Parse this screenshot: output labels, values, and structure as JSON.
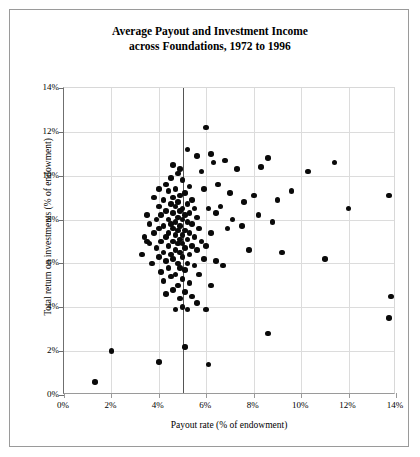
{
  "chart_data": {
    "type": "scatter",
    "title": "Average Payout and Investment Income across Foundations, 1972 to 1996",
    "title_line1": "Average Payout and Investment Income",
    "title_line2": "across Foundations, 1972 to 1996",
    "xlabel": "Payout rate (% of endowment)",
    "ylabel": "Total return on investments (% of endowment)",
    "xlim": [
      0,
      14
    ],
    "ylim": [
      0,
      14
    ],
    "xticks": [
      0,
      2,
      4,
      6,
      8,
      10,
      12,
      14
    ],
    "yticks": [
      0,
      2,
      4,
      6,
      8,
      10,
      12,
      14
    ],
    "xtick_labels": [
      "0%",
      "2%",
      "4%",
      "6%",
      "8%",
      "10%",
      "12%",
      "14%"
    ],
    "ytick_labels": [
      "0%",
      "2%",
      "4%",
      "6%",
      "8%",
      "10%",
      "12%",
      "14%"
    ],
    "grid": true,
    "legend": null,
    "marker_color": "#0a0a0a",
    "annotations": [
      {
        "type": "vline",
        "x": 5.0,
        "label": "5% payout reference line",
        "color": "#555555"
      }
    ],
    "points": [
      [
        1.3,
        0.6
      ],
      [
        2.0,
        2.0
      ],
      [
        4.0,
        1.5
      ],
      [
        5.1,
        2.2
      ],
      [
        6.1,
        1.4
      ],
      [
        8.6,
        2.8
      ],
      [
        13.7,
        3.5
      ],
      [
        13.8,
        4.5
      ],
      [
        11.0,
        6.2
      ],
      [
        6.0,
        12.2
      ],
      [
        5.2,
        11.2
      ],
      [
        5.6,
        10.9
      ],
      [
        4.6,
        10.5
      ],
      [
        4.9,
        10.3
      ],
      [
        4.8,
        10.1
      ],
      [
        4.5,
        9.9
      ],
      [
        5.0,
        9.8
      ],
      [
        4.3,
        9.6
      ],
      [
        5.3,
        9.5
      ],
      [
        4.7,
        9.4
      ],
      [
        4.4,
        9.3
      ],
      [
        5.1,
        9.2
      ],
      [
        4.9,
        9.1
      ],
      [
        4.6,
        9.0
      ],
      [
        5.4,
        8.9
      ],
      [
        4.2,
        8.9
      ],
      [
        4.8,
        8.8
      ],
      [
        5.2,
        8.7
      ],
      [
        4.5,
        8.7
      ],
      [
        4.0,
        8.6
      ],
      [
        4.7,
        8.6
      ],
      [
        5.0,
        8.5
      ],
      [
        5.5,
        8.5
      ],
      [
        4.3,
        8.4
      ],
      [
        4.9,
        8.4
      ],
      [
        5.3,
        8.3
      ],
      [
        4.6,
        8.3
      ],
      [
        4.1,
        8.2
      ],
      [
        5.1,
        8.2
      ],
      [
        4.8,
        8.1
      ],
      [
        5.6,
        8.1
      ],
      [
        4.4,
        8.0
      ],
      [
        5.0,
        8.0
      ],
      [
        3.9,
        8.0
      ],
      [
        4.7,
        7.9
      ],
      [
        5.2,
        7.9
      ],
      [
        4.5,
        7.8
      ],
      [
        5.4,
        7.8
      ],
      [
        4.2,
        7.7
      ],
      [
        4.9,
        7.7
      ],
      [
        5.7,
        7.6
      ],
      [
        4.6,
        7.6
      ],
      [
        4.0,
        7.6
      ],
      [
        5.1,
        7.5
      ],
      [
        4.8,
        7.5
      ],
      [
        5.3,
        7.4
      ],
      [
        4.4,
        7.4
      ],
      [
        3.8,
        7.4
      ],
      [
        5.0,
        7.3
      ],
      [
        4.7,
        7.3
      ],
      [
        5.5,
        7.2
      ],
      [
        4.3,
        7.2
      ],
      [
        4.9,
        7.1
      ],
      [
        5.2,
        7.1
      ],
      [
        4.1,
        7.0
      ],
      [
        4.6,
        7.0
      ],
      [
        5.8,
        7.0
      ],
      [
        3.5,
        7.0
      ],
      [
        5.0,
        6.9
      ],
      [
        4.8,
        6.9
      ],
      [
        5.4,
        6.8
      ],
      [
        4.4,
        6.8
      ],
      [
        3.9,
        6.7
      ],
      [
        5.1,
        6.7
      ],
      [
        4.7,
        6.6
      ],
      [
        5.6,
        6.6
      ],
      [
        4.2,
        6.5
      ],
      [
        4.9,
        6.5
      ],
      [
        5.3,
        6.4
      ],
      [
        4.5,
        6.4
      ],
      [
        4.0,
        6.3
      ],
      [
        5.0,
        6.3
      ],
      [
        5.9,
        6.2
      ],
      [
        4.6,
        6.2
      ],
      [
        4.3,
        6.1
      ],
      [
        5.2,
        6.0
      ],
      [
        4.8,
        6.0
      ],
      [
        3.7,
        6.0
      ],
      [
        5.5,
        5.9
      ],
      [
        4.4,
        5.8
      ],
      [
        4.9,
        5.8
      ],
      [
        5.1,
        5.7
      ],
      [
        4.1,
        5.6
      ],
      [
        4.7,
        5.5
      ],
      [
        5.7,
        5.5
      ],
      [
        4.5,
        5.4
      ],
      [
        5.0,
        5.3
      ],
      [
        4.2,
        5.2
      ],
      [
        5.3,
        5.1
      ],
      [
        4.8,
        5.0
      ],
      [
        6.2,
        5.0
      ],
      [
        4.6,
        4.8
      ],
      [
        5.1,
        4.7
      ],
      [
        4.3,
        4.6
      ],
      [
        5.4,
        4.5
      ],
      [
        4.9,
        4.4
      ],
      [
        5.0,
        4.0
      ],
      [
        4.7,
        3.9
      ],
      [
        5.2,
        3.9
      ],
      [
        3.4,
        7.2
      ],
      [
        3.6,
        7.8
      ],
      [
        3.3,
        6.4
      ],
      [
        3.5,
        8.2
      ],
      [
        3.8,
        9.0
      ],
      [
        4.0,
        9.4
      ],
      [
        6.3,
        10.6
      ],
      [
        6.8,
        10.7
      ],
      [
        7.3,
        10.3
      ],
      [
        6.5,
        9.6
      ],
      [
        7.0,
        9.2
      ],
      [
        7.6,
        8.8
      ],
      [
        6.6,
        8.6
      ],
      [
        6.1,
        8.5
      ],
      [
        6.4,
        8.3
      ],
      [
        7.1,
        8.0
      ],
      [
        6.9,
        7.6
      ],
      [
        7.5,
        7.7
      ],
      [
        6.2,
        7.4
      ],
      [
        8.0,
        9.1
      ],
      [
        8.3,
        10.4
      ],
      [
        8.6,
        10.8
      ],
      [
        9.0,
        8.9
      ],
      [
        8.2,
        8.2
      ],
      [
        8.8,
        7.9
      ],
      [
        9.6,
        9.3
      ],
      [
        10.3,
        10.2
      ],
      [
        11.4,
        10.6
      ],
      [
        12.0,
        8.5
      ],
      [
        13.7,
        9.1
      ],
      [
        9.2,
        6.5
      ],
      [
        6.0,
        6.8
      ],
      [
        6.4,
        6.1
      ],
      [
        6.7,
        5.9
      ],
      [
        5.9,
        9.4
      ],
      [
        6.2,
        11.0
      ],
      [
        5.8,
        10.2
      ],
      [
        7.8,
        6.6
      ],
      [
        5.6,
        4.2
      ],
      [
        6.0,
        3.9
      ],
      [
        3.6,
        6.9
      ]
    ]
  }
}
